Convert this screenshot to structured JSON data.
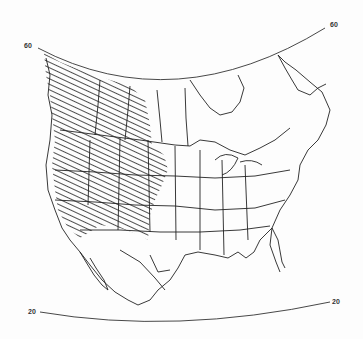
{
  "map": {
    "title": "",
    "region": "North America",
    "latitude_labels": [
      {
        "id": "lat60_left",
        "text": "60"
      },
      {
        "id": "lat60_right",
        "text": "60"
      },
      {
        "id": "lat20_left",
        "text": "20"
      },
      {
        "id": "lat20_right",
        "text": "20"
      }
    ],
    "legend": {
      "hatched_area": "Distribution range (western North America)"
    },
    "colors": {
      "ink": "#222222",
      "background": "#fdfdfd"
    }
  }
}
